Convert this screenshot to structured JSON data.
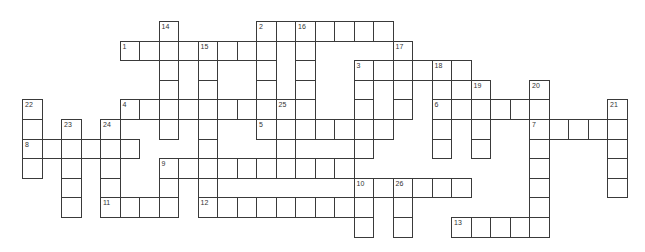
{
  "puzzle": {
    "type": "crossword",
    "grid": {
      "origin_x": 22,
      "origin_y": 21,
      "cell_w": 19.5,
      "cell_h": 19.6,
      "cols": 31,
      "rows": 11
    },
    "colors": {
      "line": "#3a3a3a",
      "background": "#ffffff",
      "cell": "#ffffff"
    },
    "clue_numbers": [
      1,
      2,
      3,
      4,
      5,
      6,
      7,
      8,
      9,
      10,
      11,
      12,
      13,
      14,
      15,
      16,
      17,
      18,
      19,
      20,
      21,
      22,
      23,
      24,
      25,
      26
    ],
    "entries": [
      {
        "number": 1,
        "direction": "across",
        "row": 1,
        "col": 5,
        "length": 8
      },
      {
        "number": 2,
        "direction": "across",
        "row": 0,
        "col": 12,
        "length": 7
      },
      {
        "number": 2,
        "direction": "down",
        "row": 0,
        "col": 12,
        "length": 6
      },
      {
        "number": 3,
        "direction": "across",
        "row": 2,
        "col": 17,
        "length": 6
      },
      {
        "number": 3,
        "direction": "down",
        "row": 2,
        "col": 17,
        "length": 5
      },
      {
        "number": 4,
        "direction": "across",
        "row": 4,
        "col": 5,
        "length": 10
      },
      {
        "number": 5,
        "direction": "across",
        "row": 5,
        "col": 12,
        "length": 7
      },
      {
        "number": 6,
        "direction": "across",
        "row": 4,
        "col": 21,
        "length": 6
      },
      {
        "number": 7,
        "direction": "across",
        "row": 5,
        "col": 26,
        "length": 5
      },
      {
        "number": 8,
        "direction": "across",
        "row": 6,
        "col": 0,
        "length": 6
      },
      {
        "number": 9,
        "direction": "across",
        "row": 7,
        "col": 7,
        "length": 10
      },
      {
        "number": 9,
        "direction": "down",
        "row": 7,
        "col": 7,
        "length": 3
      },
      {
        "number": 10,
        "direction": "across",
        "row": 8,
        "col": 17,
        "length": 6
      },
      {
        "number": 10,
        "direction": "down",
        "row": 8,
        "col": 17,
        "length": 3
      },
      {
        "number": 11,
        "direction": "across",
        "row": 9,
        "col": 4,
        "length": 4
      },
      {
        "number": 12,
        "direction": "across",
        "row": 9,
        "col": 9,
        "length": 9
      },
      {
        "number": 13,
        "direction": "across",
        "row": 10,
        "col": 22,
        "length": 5
      },
      {
        "number": 14,
        "direction": "down",
        "row": 0,
        "col": 7,
        "length": 6
      },
      {
        "number": 15,
        "direction": "down",
        "row": 1,
        "col": 9,
        "length": 9
      },
      {
        "number": 16,
        "direction": "down",
        "row": 0,
        "col": 14,
        "length": 6
      },
      {
        "number": 17,
        "direction": "down",
        "row": 1,
        "col": 19,
        "length": 4
      },
      {
        "number": 18,
        "direction": "down",
        "row": 2,
        "col": 21,
        "length": 5
      },
      {
        "number": 19,
        "direction": "down",
        "row": 3,
        "col": 23,
        "length": 4
      },
      {
        "number": 20,
        "direction": "down",
        "row": 3,
        "col": 26,
        "length": 8
      },
      {
        "number": 21,
        "direction": "down",
        "row": 4,
        "col": 30,
        "length": 5
      },
      {
        "number": 22,
        "direction": "down",
        "row": 4,
        "col": 0,
        "length": 4
      },
      {
        "number": 23,
        "direction": "down",
        "row": 5,
        "col": 2,
        "length": 5
      },
      {
        "number": 24,
        "direction": "down",
        "row": 5,
        "col": 4,
        "length": 5
      },
      {
        "number": 25,
        "direction": "down",
        "row": 4,
        "col": 13,
        "length": 4
      },
      {
        "number": 26,
        "direction": "down",
        "row": 8,
        "col": 19,
        "length": 3
      }
    ]
  }
}
